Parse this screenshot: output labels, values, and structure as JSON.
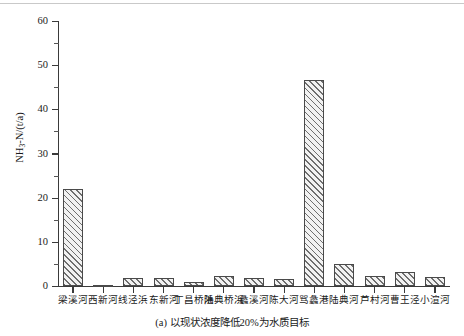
{
  "figure": {
    "caption": "(a) 以现状浓度降低20%为水质目标",
    "axis_color": "#3a3a3a",
    "bar_edge_color": "#4a4a4a",
    "bar_hatch_color": "#6e6e6e"
  },
  "chart_data": {
    "type": "bar",
    "title": "",
    "subtitle": "",
    "xlabel": "",
    "ylabel": "NH₃-N/(t/a)",
    "ylabel_parts": {
      "pre": "NH",
      "sub": "3",
      "post": "-N/(t/a)"
    },
    "ylim": [
      0,
      60
    ],
    "yticks": [
      0,
      10,
      20,
      30,
      40,
      50,
      60
    ],
    "ytick_labels": [
      "0",
      "10",
      "20",
      "30",
      "40",
      "50",
      "60"
    ],
    "yminor_ticks": [
      5,
      15,
      25,
      35,
      45,
      55
    ],
    "grid": false,
    "legend": null,
    "categories": [
      "梁溪河",
      "西新河",
      "线泾浜",
      "东新河",
      "丁昌桥浜",
      "陆典桥浜",
      "蠡溪河",
      "陈大河",
      "骂蠡港",
      "陆典河",
      "芦村河",
      "曹王泾",
      "小渲河"
    ],
    "values": [
      22.0,
      0.3,
      2.0,
      1.9,
      1.0,
      2.3,
      1.9,
      1.7,
      46.7,
      5.2,
      2.4,
      3.2,
      2.1
    ],
    "annotations": []
  }
}
